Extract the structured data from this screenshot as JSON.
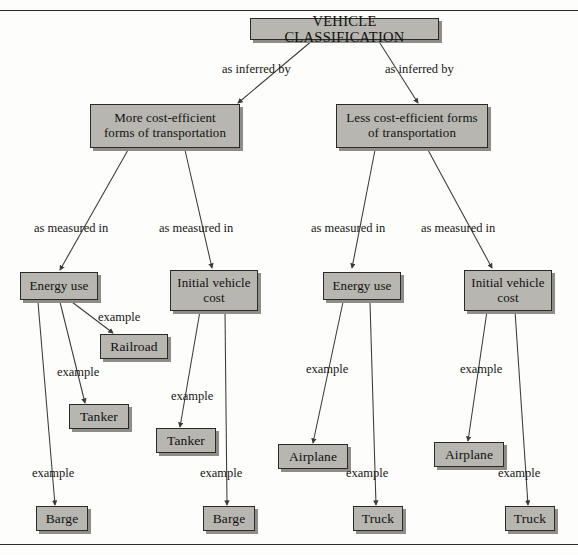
{
  "page": {
    "top_rule": true,
    "bottom_rule": true,
    "box_fill": "#b7b6b0",
    "box_border": "#2a2a28",
    "box_shadow": "#8e8d88",
    "line_color": "#3a3a38",
    "background": "#fdfdfb"
  },
  "diagram": {
    "type": "concept-map",
    "root": {
      "label": "VEHICLE CLASSIFICATION"
    },
    "branches": [
      {
        "label": "More cost-efficient forms of transportation",
        "line1": "More cost-efficient",
        "line2": "forms of transportation"
      },
      {
        "label": "Less cost-efficient forms of transportation",
        "line1": "Less cost-efficient forms",
        "line2": "of transportation"
      }
    ],
    "measures": [
      {
        "label": "Energy use",
        "line1": "Energy use",
        "line2": ""
      },
      {
        "label": "Initial vehicle cost",
        "line1": "Initial vehicle",
        "line2": "cost"
      },
      {
        "label": "Energy use",
        "line1": "Energy use",
        "line2": ""
      },
      {
        "label": "Initial vehicle cost",
        "line1": "Initial vehicle",
        "line2": "cost"
      }
    ],
    "leaves": [
      {
        "label": "Railroad"
      },
      {
        "label": "Tanker"
      },
      {
        "label": "Barge"
      },
      {
        "label": "Tanker"
      },
      {
        "label": "Barge"
      },
      {
        "label": "Airplane"
      },
      {
        "label": "Truck"
      },
      {
        "label": "Airplane"
      },
      {
        "label": "Truck"
      }
    ],
    "edge_labels": {
      "as_inferred_by_left": "as inferred by",
      "as_inferred_by_right": "as inferred by",
      "as_measured_in_1": "as measured in",
      "as_measured_in_2": "as measured in",
      "as_measured_in_3": "as measured in",
      "as_measured_in_4": "as measured in",
      "example_1": "example",
      "example_2": "example",
      "example_3": "example",
      "example_4": "example",
      "example_5": "example",
      "example_6": "example",
      "example_7": "example",
      "example_8": "example",
      "example_9": "example"
    }
  }
}
